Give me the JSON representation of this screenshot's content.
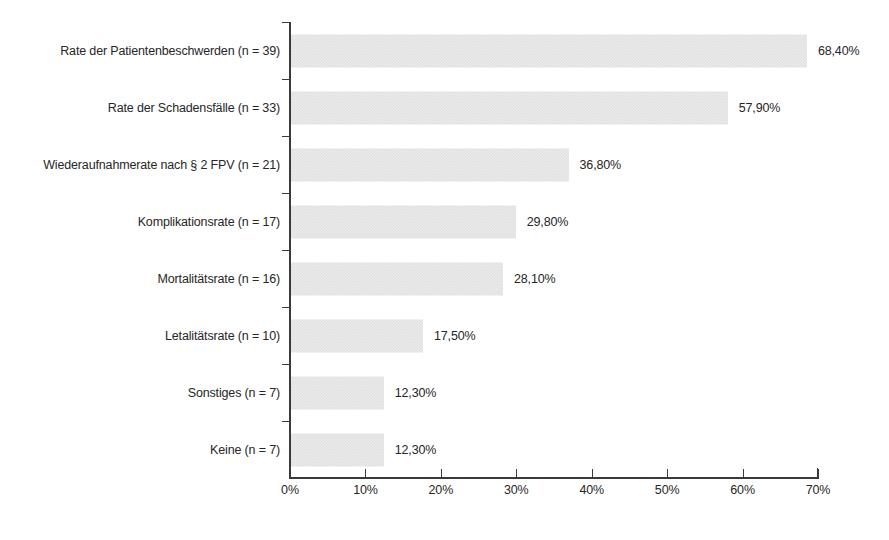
{
  "chart_data": {
    "type": "bar",
    "orientation": "horizontal",
    "title": "",
    "subtitle": "",
    "xlabel": "",
    "ylabel": "",
    "xlim": [
      0,
      70
    ],
    "grid": false,
    "legend": false,
    "decimal_separator": ",",
    "categories": [
      "Rate der Patientenbeschwerden (n = 39)",
      "Rate der Schadensfälle (n = 33)",
      "Wiederaufnahmerate nach § 2 FPV (n = 21)",
      "Komplikationsrate (n = 17)",
      "Mortalitätsrate (n = 16)",
      "Letalitätsrate (n = 10)",
      "Sonstiges (n = 7)",
      "Keine (n = 7)"
    ],
    "values": [
      68.4,
      57.9,
      36.8,
      29.8,
      28.1,
      17.5,
      12.3,
      12.3
    ],
    "value_labels": [
      "68,40%",
      "57,90%",
      "36,80%",
      "29,80%",
      "28,10%",
      "17,50%",
      "12,30%",
      "12,30%"
    ],
    "counts": [
      39,
      33,
      21,
      17,
      16,
      10,
      7,
      7
    ],
    "xticks": [
      0,
      10,
      20,
      30,
      40,
      50,
      60,
      70
    ],
    "xtick_labels": [
      "0%",
      "10%",
      "20%",
      "30%",
      "40%",
      "50%",
      "60%",
      "70%"
    ],
    "colors": {
      "bar_fill": "#ececec",
      "bar_pattern": "#dcdcdc",
      "axis": "#3a3a3a",
      "text": "#262626",
      "background": "#ffffff"
    }
  }
}
